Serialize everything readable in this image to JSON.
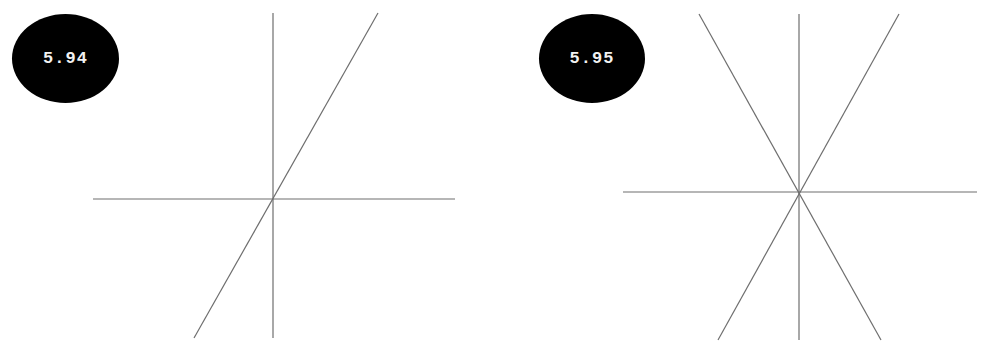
{
  "figures": [
    {
      "id": "left",
      "badge_label": "5.94",
      "lines": [
        {
          "name": "horizontal-line",
          "x1": 93,
          "y1": 199,
          "x2": 455,
          "y2": 199
        },
        {
          "name": "vertical-line",
          "x1": 273,
          "y1": 13,
          "x2": 273,
          "y2": 338
        },
        {
          "name": "diagonal-line",
          "x1": 378,
          "y1": 13,
          "x2": 194,
          "y2": 338
        }
      ]
    },
    {
      "id": "right",
      "badge_label": "5.95",
      "lines": [
        {
          "name": "horizontal-line",
          "x1": 623,
          "y1": 192,
          "x2": 977,
          "y2": 192
        },
        {
          "name": "vertical-line",
          "x1": 799,
          "y1": 14,
          "x2": 799,
          "y2": 340
        },
        {
          "name": "diagonal-line-descending",
          "x1": 699,
          "y1": 14,
          "x2": 881,
          "y2": 340
        },
        {
          "name": "diagonal-line-ascending",
          "x1": 899,
          "y1": 14,
          "x2": 718,
          "y2": 340
        }
      ]
    }
  ],
  "colors": {
    "badge_fill": "#000000",
    "badge_text": "#f2f2f2",
    "line": "#6e6e6e",
    "background": "#ffffff"
  }
}
